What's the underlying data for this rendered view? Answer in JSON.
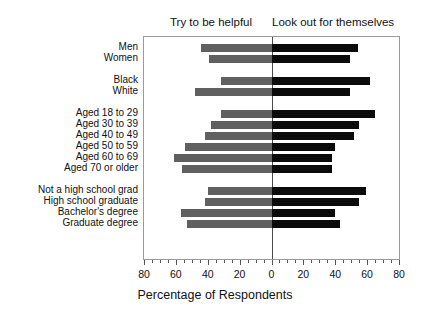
{
  "header": {
    "left_caption": "Try to be helpful",
    "right_caption": "Look out for themselves"
  },
  "axis": {
    "xlabel": "Percentage of Respondents",
    "tick_labels": [
      "80",
      "60",
      "40",
      "20",
      "0",
      "20",
      "40",
      "60",
      "80"
    ],
    "tick_values": [
      -80,
      -60,
      -40,
      -20,
      0,
      20,
      40,
      60,
      80
    ],
    "minor_tick_step": 5
  },
  "colors": {
    "helpful_bar": "#606060",
    "selfish_bar": "#0b0b0b",
    "frame": "#9a9a9a",
    "zero_line": "#4a4a4a",
    "text": "#111111",
    "background": "#ffffff"
  },
  "chart_data": {
    "type": "bar",
    "orientation": "horizontal",
    "style": "diverging",
    "title": "",
    "subtitle": "",
    "xlabel": "Percentage of Respondents",
    "ylabel": "",
    "xlim": [
      -80,
      80
    ],
    "grid": false,
    "legend_position": "top",
    "series": [
      {
        "name": "Try to be helpful",
        "color": "#606060",
        "side": "left"
      },
      {
        "name": "Look out for themselves",
        "color": "#0b0b0b",
        "side": "right"
      }
    ],
    "groups": [
      {
        "name": "Sex",
        "categories": [
          {
            "label": "Men",
            "helpful": 44,
            "selfish": 54
          },
          {
            "label": "Women",
            "helpful": 39,
            "selfish": 49
          }
        ]
      },
      {
        "name": "Race",
        "categories": [
          {
            "label": "Black",
            "helpful": 32,
            "selfish": 62
          },
          {
            "label": "White",
            "helpful": 48,
            "selfish": 49
          }
        ]
      },
      {
        "name": "Age",
        "categories": [
          {
            "label": "Aged 18 to 29",
            "helpful": 32,
            "selfish": 65
          },
          {
            "label": "Aged 30 to 39",
            "helpful": 38,
            "selfish": 55
          },
          {
            "label": "Aged 40 to 49",
            "helpful": 42,
            "selfish": 52
          },
          {
            "label": "Aged 50 to 59",
            "helpful": 54,
            "selfish": 40
          },
          {
            "label": "Aged 60 to 69",
            "helpful": 61,
            "selfish": 38
          },
          {
            "label": "Aged 70 or older",
            "helpful": 56,
            "selfish": 38
          }
        ]
      },
      {
        "name": "Education",
        "categories": [
          {
            "label": "Not a high school grad",
            "helpful": 40,
            "selfish": 59
          },
          {
            "label": "High school graduate",
            "helpful": 42,
            "selfish": 55
          },
          {
            "label": "Bachelor's degree",
            "helpful": 57,
            "selfish": 40
          },
          {
            "label": "Graduate degree",
            "helpful": 53,
            "selfish": 43
          }
        ]
      }
    ]
  }
}
